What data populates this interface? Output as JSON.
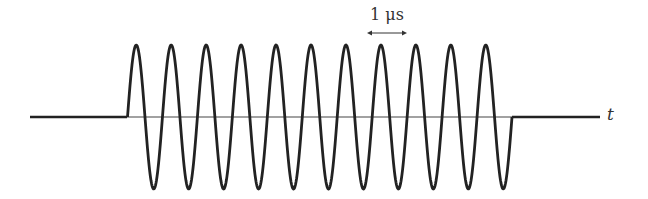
{
  "diagram": {
    "period_label": "1 μs",
    "axis_label": "t",
    "cycles": 11,
    "colors": {
      "waveform": "#222222",
      "axis": "#444444",
      "background": "#ffffff"
    }
  }
}
